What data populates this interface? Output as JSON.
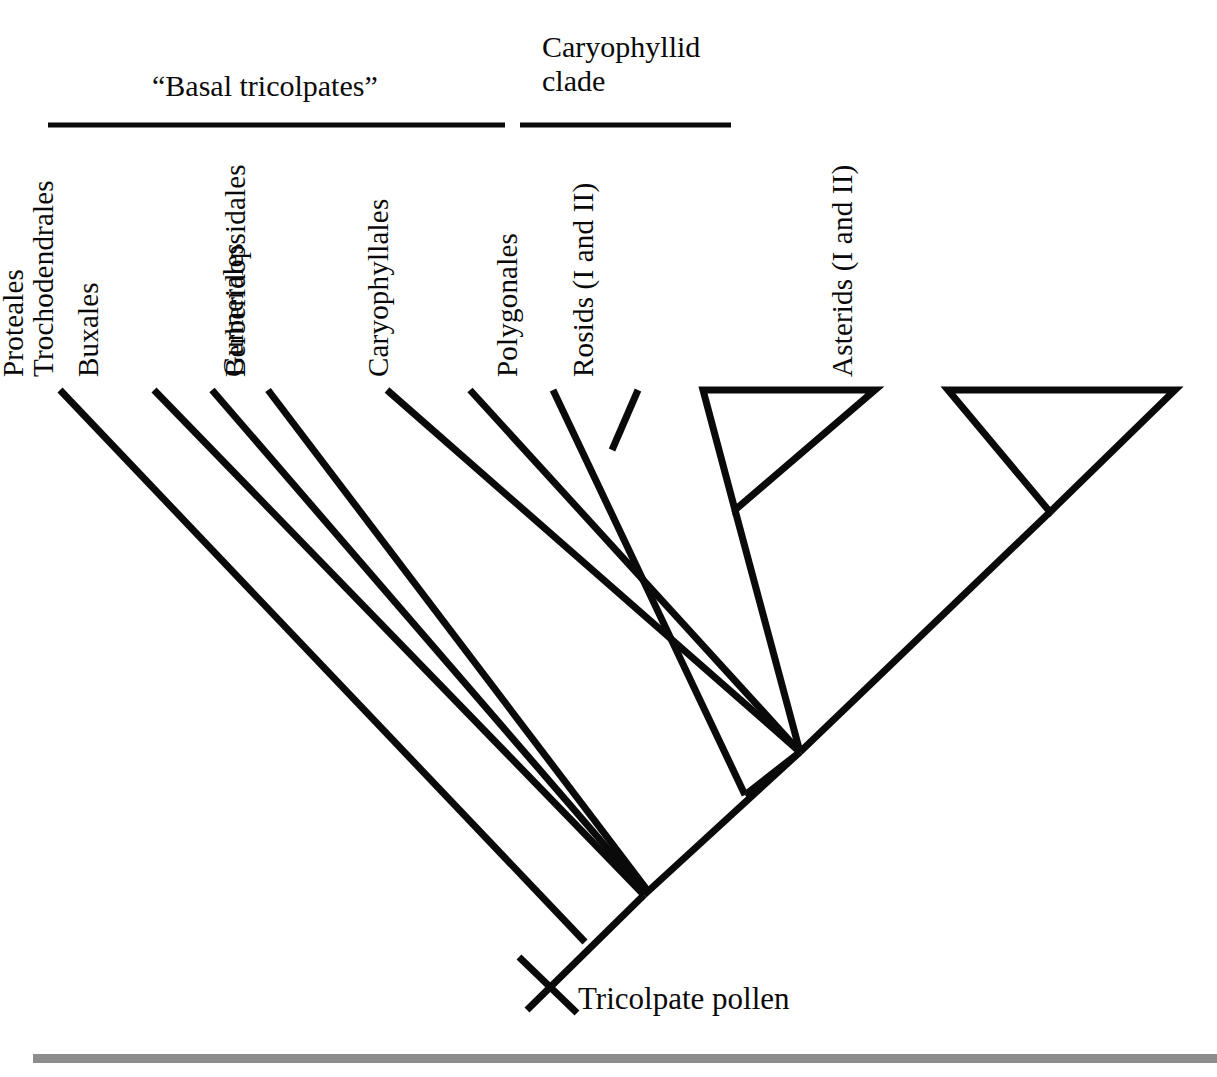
{
  "figure": {
    "kind": "phylogenetic-cladogram",
    "background_color": "#ffffff",
    "line_color": "#0a0a0a",
    "footer_rule_color": "#8d8d8d"
  },
  "group_headers": [
    {
      "id": "basal-tricolpates",
      "label": "“Basal tricolpates”",
      "rule_x1": 48,
      "rule_x2": 505,
      "rule_y": 125
    },
    {
      "id": "caryophyllid-clade",
      "label": "Caryophyllid clade",
      "rule_x1": 520,
      "rule_x2": 731,
      "rule_y": 125
    }
  ],
  "taxa": [
    {
      "id": "ranunculales",
      "label": "Ranunculales",
      "tip_x": 60,
      "tip_y": 390,
      "label_bottom_y": 377
    },
    {
      "id": "proteales",
      "label": "Proteales",
      "tip_x": 154,
      "tip_y": 390,
      "label_bottom_y": 377
    },
    {
      "id": "buxales",
      "label": "Buxales",
      "tip_x": 212,
      "tip_y": 390,
      "label_bottom_y": 377
    },
    {
      "id": "trochodendrales",
      "label": "Trochodendrales",
      "tip_x": 268,
      "tip_y": 390,
      "label_bottom_y": 377
    },
    {
      "id": "gunnerales",
      "label": "Gunnerales",
      "tip_x": 387,
      "tip_y": 390,
      "label_bottom_y": 377
    },
    {
      "id": "berberidopsidales",
      "label": "Berberidopsidales",
      "tip_x": 470,
      "tip_y": 390,
      "label_bottom_y": 377
    },
    {
      "id": "caryophyllales",
      "label": "Caryophyllales",
      "tip_x": 553,
      "tip_y": 390,
      "label_bottom_y": 377
    },
    {
      "id": "polygonales",
      "label": "Polygonales",
      "tip_x": 638,
      "tip_y": 390,
      "label_bottom_y": 377
    },
    {
      "id": "rosids",
      "label": "Rosids (I and II)",
      "tip_x": 789,
      "tip_y": 390,
      "label_bottom_y": 377
    },
    {
      "id": "asterids",
      "label": "Asterids (I and II)",
      "tip_x": 1062,
      "tip_y": 390,
      "label_bottom_y": 377
    }
  ],
  "collapsed_clades": [
    {
      "id": "rosids-triangle",
      "label": "Rosids (I and II)",
      "apex_x": 735,
      "apex_y": 510,
      "bar_left_x": 703,
      "bar_right_x": 875,
      "bar_y": 390
    },
    {
      "id": "asterids-triangle",
      "label": "Asterids (I and II)",
      "apex_x": 1050,
      "apex_y": 512,
      "bar_left_x": 948,
      "bar_right_x": 1175,
      "bar_y": 390
    }
  ],
  "nodes": [
    {
      "id": "tricolpate-basal-node",
      "x": 644,
      "y": 895
    },
    {
      "id": "core-eudicot-node",
      "x": 800,
      "y": 752
    },
    {
      "id": "caryophyllid-stem-node",
      "x": 745,
      "y": 795
    },
    {
      "id": "caryophyllid-v-node",
      "x": 612,
      "y": 450
    },
    {
      "id": "root-end",
      "x": 527,
      "y": 1010
    }
  ],
  "character_state": {
    "id": "tricolpate-pollen",
    "label": "Tricolpate pollen",
    "tick_center_x": 548,
    "tick_center_y": 985,
    "label_x": 578,
    "label_y": 983
  },
  "footer_rule": {
    "x": 33,
    "y": 1054,
    "width": 1184,
    "height": 9
  }
}
